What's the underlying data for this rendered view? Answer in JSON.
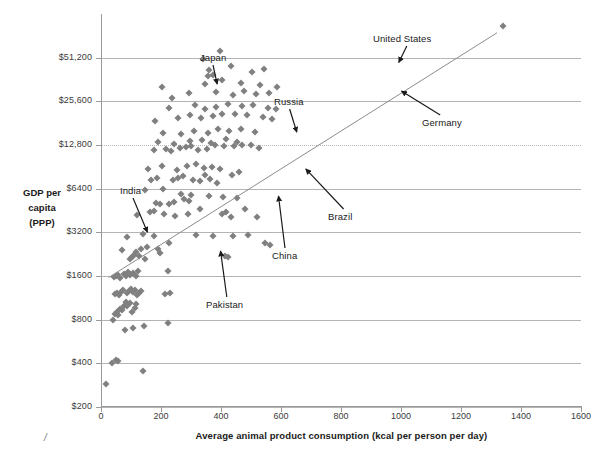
{
  "chart_data": {
    "type": "scatter",
    "title": "",
    "xlabel": "Average animal product consumption (kcal per person per day)",
    "ylabel": "GDP per capita (PPP)",
    "ylabel_lines": [
      "GDP per",
      "capita",
      "(PPP)"
    ],
    "xlim": [
      0,
      1600
    ],
    "ylim": [
      200,
      102400
    ],
    "yscale": "log2",
    "xticks": [
      0,
      200,
      400,
      600,
      800,
      1000,
      1200,
      1400,
      1600
    ],
    "xtick_labels": [
      "0",
      "200",
      "400",
      "600",
      "800",
      "1000",
      "1200",
      "1400",
      "1600"
    ],
    "yticks": [
      200,
      400,
      800,
      1600,
      3200,
      6400,
      12800,
      25600,
      51200
    ],
    "ytick_labels": [
      "$200",
      "$400",
      "$800",
      "$1600",
      "$3200",
      "$6400",
      "$12,800",
      "$25,600",
      "$51,200"
    ],
    "grid": "horizontal",
    "legend": "none",
    "marker": "diamond",
    "marker_color": "#808080",
    "gridline_color": "#b4b4b4",
    "trendline": {
      "present": true,
      "color": "#8c8c8c",
      "x_start": 25,
      "y_start": 1560,
      "x_end": 1320,
      "y_end": 76000
    },
    "annotations": [
      {
        "label": "Japan",
        "label_x": 200,
        "label_y": 52,
        "tip_x": 218,
        "tip_y": 88
      },
      {
        "label": "Russia",
        "label_x": 274,
        "label_y": 96,
        "tip_x": 298,
        "tip_y": 136
      },
      {
        "label": "United States",
        "label_x": 373,
        "label_y": 33,
        "tip_x": 397,
        "tip_y": 66
      },
      {
        "label": "Germany",
        "label_x": 422,
        "label_y": 117,
        "tip_x": 398,
        "tip_y": 89
      },
      {
        "label": "India",
        "label_x": 120,
        "label_y": 185,
        "tip_x": 149,
        "tip_y": 236
      },
      {
        "label": "Brazil",
        "label_x": 328,
        "label_y": 211,
        "tip_x": 303,
        "tip_y": 166
      },
      {
        "label": "China",
        "label_x": 272,
        "label_y": 250,
        "tip_x": 278,
        "tip_y": 192
      },
      {
        "label": "Pakistan",
        "label_x": 206,
        "label_y": 299,
        "tip_x": 220,
        "tip_y": 247
      }
    ],
    "points": [
      [
        18,
        290
      ],
      [
        38,
        400
      ],
      [
        50,
        420
      ],
      [
        55,
        415
      ],
      [
        140,
        355
      ],
      [
        40,
        790
      ],
      [
        47,
        880
      ],
      [
        52,
        900
      ],
      [
        58,
        860
      ],
      [
        62,
        950
      ],
      [
        70,
        930
      ],
      [
        78,
        1000
      ],
      [
        84,
        1060
      ],
      [
        88,
        990
      ],
      [
        96,
        1040
      ],
      [
        104,
        900
      ],
      [
        112,
        960
      ],
      [
        118,
        1030
      ],
      [
        80,
        680
      ],
      [
        106,
        700
      ],
      [
        142,
        720
      ],
      [
        224,
        760
      ],
      [
        45,
        1210
      ],
      [
        54,
        1230
      ],
      [
        60,
        1190
      ],
      [
        68,
        1250
      ],
      [
        72,
        1280
      ],
      [
        86,
        1220
      ],
      [
        92,
        1260
      ],
      [
        100,
        1300
      ],
      [
        108,
        1240
      ],
      [
        114,
        1290
      ],
      [
        120,
        1190
      ],
      [
        128,
        1230
      ],
      [
        134,
        1270
      ],
      [
        212,
        1200
      ],
      [
        230,
        1215
      ],
      [
        42,
        1580
      ],
      [
        50,
        1600
      ],
      [
        56,
        1620
      ],
      [
        64,
        1560
      ],
      [
        76,
        1650
      ],
      [
        82,
        1600
      ],
      [
        90,
        1700
      ],
      [
        98,
        1630
      ],
      [
        106,
        1680
      ],
      [
        116,
        1590
      ],
      [
        124,
        1720
      ],
      [
        222,
        1740
      ],
      [
        70,
        2400
      ],
      [
        96,
        2100
      ],
      [
        102,
        2150
      ],
      [
        110,
        2250
      ],
      [
        118,
        2350
      ],
      [
        126,
        2200
      ],
      [
        134,
        2450
      ],
      [
        146,
        2100
      ],
      [
        154,
        2550
      ],
      [
        190,
        2450
      ],
      [
        198,
        2300
      ],
      [
        226,
        2700
      ],
      [
        414,
        2200
      ],
      [
        422,
        2150
      ],
      [
        88,
        2950
      ],
      [
        140,
        3100
      ],
      [
        178,
        3000
      ],
      [
        318,
        3050
      ],
      [
        440,
        3000
      ],
      [
        490,
        3050
      ],
      [
        548,
        2700
      ],
      [
        562,
        2600
      ],
      [
        374,
        3000
      ],
      [
        120,
        4200
      ],
      [
        164,
        4400
      ],
      [
        176,
        4500
      ],
      [
        210,
        4300
      ],
      [
        246,
        4150
      ],
      [
        290,
        4250
      ],
      [
        330,
        4600
      ],
      [
        404,
        4300
      ],
      [
        418,
        4400
      ],
      [
        432,
        4100
      ],
      [
        480,
        4600
      ],
      [
        520,
        4100
      ],
      [
        148,
        6300
      ],
      [
        208,
        6350
      ],
      [
        276,
        5400
      ],
      [
        292,
        5300
      ],
      [
        360,
        5700
      ],
      [
        408,
        5600
      ],
      [
        452,
        5500
      ],
      [
        182,
        5100
      ],
      [
        196,
        5000
      ],
      [
        228,
        5000
      ],
      [
        244,
        5200
      ],
      [
        266,
        5900
      ],
      [
        300,
        5800
      ],
      [
        168,
        7400
      ],
      [
        186,
        7600
      ],
      [
        240,
        7300
      ],
      [
        258,
        7600
      ],
      [
        272,
        7800
      ],
      [
        308,
        7400
      ],
      [
        330,
        7200
      ],
      [
        348,
        7900
      ],
      [
        364,
        7500
      ],
      [
        386,
        7000
      ],
      [
        158,
        8800
      ],
      [
        204,
        9100
      ],
      [
        252,
        8600
      ],
      [
        286,
        9200
      ],
      [
        316,
        9500
      ],
      [
        342,
        8900
      ],
      [
        370,
        9000
      ],
      [
        396,
        8700
      ],
      [
        436,
        8000
      ],
      [
        460,
        8400
      ],
      [
        176,
        11800
      ],
      [
        216,
        12000
      ],
      [
        232,
        11600
      ],
      [
        264,
        12200
      ],
      [
        282,
        12400
      ],
      [
        300,
        12600
      ],
      [
        324,
        11900
      ],
      [
        352,
        12100
      ],
      [
        380,
        12800
      ],
      [
        410,
        12600
      ],
      [
        442,
        12500
      ],
      [
        470,
        12900
      ],
      [
        500,
        12700
      ],
      [
        528,
        12300
      ],
      [
        190,
        13400
      ],
      [
        244,
        13100
      ],
      [
        296,
        13600
      ],
      [
        338,
        13900
      ],
      [
        366,
        13200
      ],
      [
        418,
        14000
      ],
      [
        454,
        13500
      ],
      [
        206,
        15600
      ],
      [
        268,
        15200
      ],
      [
        310,
        15900
      ],
      [
        356,
        15400
      ],
      [
        390,
        16400
      ],
      [
        428,
        16000
      ],
      [
        466,
        16500
      ],
      [
        512,
        15800
      ],
      [
        180,
        18800
      ],
      [
        258,
        19600
      ],
      [
        298,
        20500
      ],
      [
        334,
        19800
      ],
      [
        372,
        20200
      ],
      [
        402,
        21000
      ],
      [
        448,
        20800
      ],
      [
        486,
        20600
      ],
      [
        540,
        20000
      ],
      [
        570,
        19400
      ],
      [
        226,
        23000
      ],
      [
        314,
        24000
      ],
      [
        348,
        22600
      ],
      [
        384,
        23500
      ],
      [
        424,
        24600
      ],
      [
        470,
        23800
      ],
      [
        508,
        24200
      ],
      [
        556,
        23000
      ],
      [
        582,
        22600
      ],
      [
        236,
        27000
      ],
      [
        294,
        29000
      ],
      [
        382,
        29500
      ],
      [
        440,
        28500
      ],
      [
        476,
        30000
      ],
      [
        518,
        28800
      ],
      [
        560,
        29400
      ],
      [
        202,
        32000
      ],
      [
        346,
        33500
      ],
      [
        404,
        36000
      ],
      [
        468,
        34000
      ],
      [
        530,
        33000
      ],
      [
        586,
        32000
      ],
      [
        360,
        42000
      ],
      [
        434,
        45000
      ],
      [
        502,
        41000
      ],
      [
        544,
        43000
      ],
      [
        340,
        50500
      ],
      [
        398,
        57000
      ],
      [
        372,
        39000
      ],
      [
        356,
        38000
      ],
      [
        1340,
        84000
      ]
    ]
  }
}
